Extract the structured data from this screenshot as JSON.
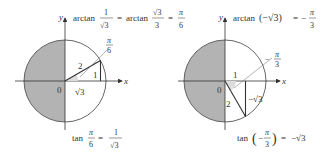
{
  "figure": {
    "colors": {
      "shade": "#b3b3b3",
      "line": "#333333",
      "circle": "#555555",
      "background": "#ffffff"
    },
    "left_panel": {
      "axis_x_label": "x",
      "axis_y_label": "y",
      "origin_label": "0",
      "hypotenuse_label": "2",
      "opposite_label": "1",
      "adjacent_label": "√3",
      "angle_label_num": "π",
      "angle_label_den": "6",
      "top_equation": {
        "prefix": "arctan",
        "frac1_num": "1",
        "frac1_den": "√3",
        "equals1": "=",
        "mid": "arctan",
        "frac2_num": "√3",
        "frac2_den": "3",
        "equals2": "=",
        "frac3_num": "π",
        "frac3_den": "6"
      },
      "bottom_equation": {
        "prefix": "tan",
        "frac1_num": "π",
        "frac1_den": "6",
        "equals": "=",
        "frac2_num": "1",
        "frac2_den": "√3"
      }
    },
    "right_panel": {
      "axis_x_label": "x",
      "axis_y_label": "y",
      "origin_label": "0",
      "hypotenuse_label": "2",
      "adjacent_label": "1",
      "opposite_label": "−√3",
      "angle_label_sign": "−",
      "angle_label_num": "π",
      "angle_label_den": "3",
      "top_equation": {
        "prefix": "arctan",
        "arg": "(−√3)",
        "equals": "=",
        "sign": "−",
        "frac_num": "π",
        "frac_den": "3"
      },
      "bottom_equation": {
        "prefix": "tan",
        "arg_sign": "−",
        "arg_num": "π",
        "arg_den": "3",
        "equals": "=",
        "result": "−√3"
      }
    }
  }
}
